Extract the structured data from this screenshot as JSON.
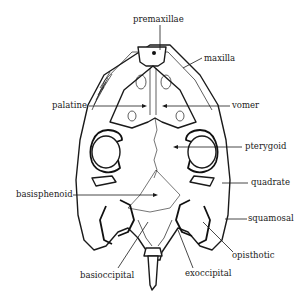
{
  "figure": {
    "labels": [
      {
        "id": "premaxillae",
        "text": "premaxillae"
      },
      {
        "id": "maxilla",
        "text": "maxilla"
      },
      {
        "id": "palatine",
        "text": "palatine"
      },
      {
        "id": "vomer",
        "text": "vomer"
      },
      {
        "id": "pterygoid",
        "text": "pterygoid"
      },
      {
        "id": "quadrate",
        "text": "quadrate"
      },
      {
        "id": "basisphenoid",
        "text": "basisphenoid"
      },
      {
        "id": "squamosal",
        "text": "squamosal"
      },
      {
        "id": "opisthotic",
        "text": "opisthotic"
      },
      {
        "id": "basioccipital",
        "text": "basioccipital"
      },
      {
        "id": "exoccipital",
        "text": "exoccipital"
      }
    ]
  },
  "colors": {
    "ink": "#1a1a1a",
    "background": "#ffffff"
  }
}
